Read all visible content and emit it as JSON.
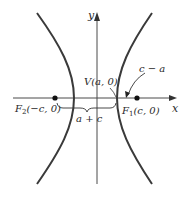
{
  "diagram": {
    "type": "hyperbola-foci",
    "axes": {
      "x_label": "x",
      "y_label": "y"
    },
    "points": {
      "focus_left": {
        "label": "F",
        "sub": "2",
        "coords": "(−c, 0)"
      },
      "focus_right": {
        "label": "F",
        "sub": "1",
        "coords": "(c, 0)"
      },
      "vertex": {
        "label": "V(a, 0)"
      }
    },
    "annotations": {
      "distance_sum": "a + c",
      "distance_diff": "c − a"
    },
    "colors": {
      "curve": "#3a3a3a",
      "axis": "#4a4a4a",
      "text": "#2a2a2a"
    }
  }
}
